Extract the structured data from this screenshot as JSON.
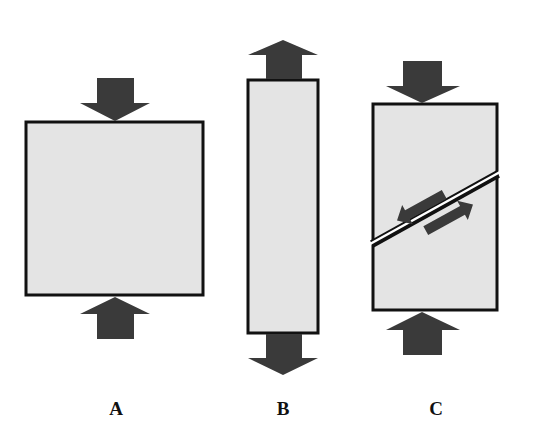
{
  "colors": {
    "block_fill": "#e4e4e4",
    "block_stroke": "#111111",
    "arrow_fill": "#3a3a3a",
    "background": "#ffffff"
  },
  "panels": [
    {
      "id": "A",
      "label": "A",
      "stress_type": "compression",
      "label_x": 116,
      "label_y": 398
    },
    {
      "id": "B",
      "label": "B",
      "stress_type": "tension",
      "label_x": 283,
      "label_y": 398
    },
    {
      "id": "C",
      "label": "C",
      "stress_type": "shear",
      "label_x": 436,
      "label_y": 398
    }
  ]
}
